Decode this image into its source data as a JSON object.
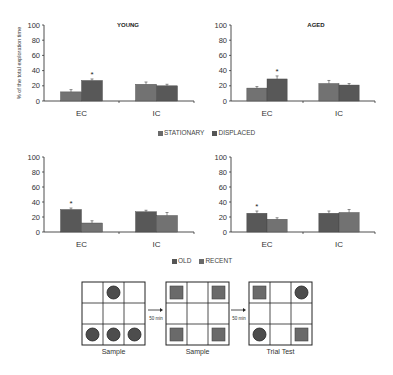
{
  "chart_data": [
    {
      "type": "bar",
      "title": "YOUNG",
      "ylabel": "% of the total exploration time",
      "xlabel": "",
      "categories": [
        "EC",
        "IC"
      ],
      "ylim": [
        0,
        100
      ],
      "yticks": [
        0,
        20,
        40,
        60,
        80,
        100
      ],
      "series": [
        {
          "name": "STATIONARY",
          "values": [
            12,
            22
          ],
          "errors": [
            3,
            3
          ]
        },
        {
          "name": "DISPLACED",
          "values": [
            27,
            20
          ],
          "errors": [
            2,
            2
          ]
        }
      ],
      "annotations": [
        {
          "category": "EC",
          "series": "DISPLACED",
          "text": "*"
        }
      ],
      "legend_position": "bottom"
    },
    {
      "type": "bar",
      "title": "AGED",
      "ylabel": "",
      "xlabel": "",
      "categories": [
        "EC",
        "IC"
      ],
      "ylim": [
        0,
        100
      ],
      "yticks": [
        0,
        20,
        40,
        60,
        80,
        100
      ],
      "series": [
        {
          "name": "STATIONARY",
          "values": [
            17,
            23
          ],
          "errors": [
            2,
            4
          ]
        },
        {
          "name": "DISPLACED",
          "values": [
            29,
            21
          ],
          "errors": [
            4,
            2
          ]
        }
      ],
      "annotations": [
        {
          "category": "EC",
          "series": "DISPLACED",
          "text": "*"
        }
      ],
      "legend_position": "bottom"
    },
    {
      "type": "bar",
      "title": "",
      "ylabel": "",
      "xlabel": "",
      "categories": [
        "EC",
        "IC"
      ],
      "ylim": [
        0,
        100
      ],
      "yticks": [
        0,
        20,
        40,
        60,
        80,
        100
      ],
      "series": [
        {
          "name": "OLD",
          "values": [
            30,
            27
          ],
          "errors": [
            2,
            2
          ]
        },
        {
          "name": "RECENT",
          "values": [
            12,
            22
          ],
          "errors": [
            3,
            4
          ]
        }
      ],
      "annotations": [
        {
          "category": "EC",
          "series": "OLD",
          "text": "*"
        }
      ],
      "legend_position": "bottom"
    },
    {
      "type": "bar",
      "title": "",
      "ylabel": "",
      "xlabel": "",
      "categories": [
        "EC",
        "IC"
      ],
      "ylim": [
        0,
        100
      ],
      "yticks": [
        0,
        20,
        40,
        60,
        80,
        100
      ],
      "series": [
        {
          "name": "OLD",
          "values": [
            25,
            25
          ],
          "errors": [
            3,
            3
          ]
        },
        {
          "name": "RECENT",
          "values": [
            17,
            26
          ],
          "errors": [
            2,
            4
          ]
        }
      ],
      "annotations": [
        {
          "category": "EC",
          "series": "OLD",
          "text": "*"
        }
      ],
      "legend_position": "bottom"
    }
  ],
  "legends": {
    "top": [
      {
        "label": "STATIONARY",
        "color": "#6a6a6a"
      },
      {
        "label": "DISPLACED",
        "color": "#555555"
      }
    ],
    "bottom": [
      {
        "label": "OLD",
        "color": "#555555"
      },
      {
        "label": "RECENT",
        "color": "#6a6a6a"
      }
    ]
  },
  "colors": {
    "bar_dark": "#555555",
    "bar_light": "#6e6e6e",
    "axis": "#222222"
  },
  "diagram": {
    "panels": [
      {
        "caption": "Sample",
        "cells": [
          "",
          "circle",
          "",
          "",
          "",
          "",
          "circle",
          "circle",
          "circle"
        ]
      },
      {
        "caption": "Sample",
        "cells": [
          "square",
          "",
          "square",
          "",
          "",
          "",
          "square",
          "",
          "square"
        ]
      },
      {
        "caption": "Trial Test",
        "cells": [
          "square",
          "",
          "circle",
          "",
          "",
          "",
          "circle",
          "",
          "square"
        ]
      }
    ],
    "arrows": [
      {
        "label": "50 min"
      },
      {
        "label": "50 min"
      }
    ]
  }
}
